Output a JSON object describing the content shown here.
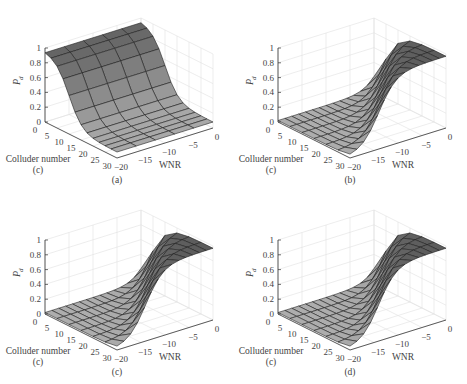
{
  "figure": {
    "panels": [
      {
        "id": "a",
        "caption": "(a)"
      },
      {
        "id": "b",
        "caption": "(b)"
      },
      {
        "id": "c",
        "caption": "(c)"
      },
      {
        "id": "d",
        "caption": "(d)"
      }
    ]
  },
  "chart_data": [
    {
      "type": "surface",
      "panel": "(a)",
      "title": "",
      "zlabel": "P_d",
      "xlabel": "Colluder number (c)",
      "ylabel": "WNR",
      "x_ticks": [
        0,
        5,
        10,
        15,
        20,
        25,
        30
      ],
      "y_ticks": [
        -20,
        -15,
        -10,
        -5,
        0
      ],
      "z_ticks": [
        0,
        0.2,
        0.4,
        0.6,
        0.8,
        1
      ],
      "zlim": [
        0,
        1
      ],
      "grid": true,
      "x": [
        0,
        5,
        10,
        15,
        20,
        25,
        30
      ],
      "y": [
        -20,
        -15,
        -10,
        -5,
        0
      ],
      "z_by_colluder": [
        0.95,
        0.9,
        0.6,
        0.35,
        0.22,
        0.15,
        0.1
      ],
      "note": "Pd decays with colluder number, nearly constant along WNR"
    },
    {
      "type": "surface",
      "panel": "(b)",
      "zlabel": "P_d",
      "xlabel": "Colluder number (c)",
      "ylabel": "WNR",
      "x_ticks": [
        0,
        5,
        10,
        15,
        20,
        25,
        30
      ],
      "y_ticks": [
        -20,
        -15,
        -10,
        -5,
        0
      ],
      "z_ticks": [
        0,
        0.2,
        0.4,
        0.6,
        0.8,
        1
      ],
      "zlim": [
        0,
        1
      ],
      "grid": true,
      "note": "Pd ≈1 at high WNR; falls toward 0 at low WNR and many colluders"
    },
    {
      "type": "surface",
      "panel": "(c)",
      "zlabel": "P_d",
      "xlabel": "Colluder number (c)",
      "ylabel": "WNR",
      "x_ticks": [
        0,
        5,
        10,
        15,
        20,
        25,
        30
      ],
      "y_ticks": [
        -20,
        -15,
        -10,
        -5,
        0
      ],
      "z_ticks": [
        0,
        0.2,
        0.4,
        0.6,
        0.8,
        1
      ],
      "zlim": [
        0,
        1
      ],
      "grid": true,
      "note": "Similar shape to (b)"
    },
    {
      "type": "surface",
      "panel": "(d)",
      "zlabel": "P_d",
      "xlabel": "Colluder number (c)",
      "ylabel": "WNR",
      "x_ticks": [
        0,
        5,
        10,
        15,
        20,
        25,
        30
      ],
      "y_ticks": [
        -20,
        -15,
        -10,
        -5,
        0
      ],
      "z_ticks": [
        0,
        0.2,
        0.4,
        0.6,
        0.8,
        1
      ],
      "zlim": [
        0,
        1
      ],
      "grid": true,
      "note": "Similar shape to (b)"
    }
  ],
  "labels": {
    "zlabel": "P",
    "zsub": "d",
    "xlabel": "Colluder number",
    "xlabel2": "(c)",
    "ylabel": "WNR",
    "x_ticks": [
      "0",
      "5",
      "10",
      "15",
      "20",
      "25",
      "30"
    ],
    "y_ticks": [
      "−20",
      "−15",
      "−10",
      "−5",
      "0"
    ],
    "z_ticks": [
      "0",
      "0.2",
      "0.4",
      "0.6",
      "0.8",
      "1"
    ]
  }
}
